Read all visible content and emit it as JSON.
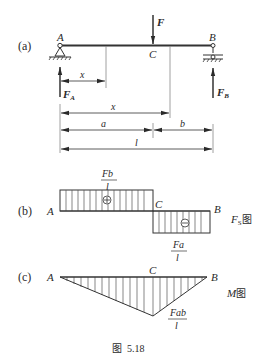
{
  "figure": {
    "caption": "图  5.18",
    "panel_a": {
      "label": "(a)",
      "point_A": "A",
      "point_B": "B",
      "point_C": "C",
      "load": "F",
      "reaction_A": "F",
      "reaction_A_sub": "A",
      "reaction_B": "F",
      "reaction_B_sub": "B",
      "dim_x_short": "x",
      "dim_x_long": "x",
      "dim_a": "a",
      "dim_b": "b",
      "dim_l": "l"
    },
    "panel_b": {
      "label": "(b)",
      "point_A": "A",
      "point_B": "B",
      "point_C": "C",
      "pos_num": "Fb",
      "pos_den": "l",
      "neg_num": "Fa",
      "neg_den": "l",
      "plus_sign": "+",
      "minus_sign": "−",
      "diagram_name": "F",
      "diagram_sub": "S",
      "diagram_suffix": "图"
    },
    "panel_c": {
      "label": "(c)",
      "point_A": "A",
      "point_B": "B",
      "point_C": "C",
      "max_num": "Fab",
      "max_den": "l",
      "diagram_name": "M",
      "diagram_suffix": "图"
    }
  },
  "colors": {
    "line": "#3a3a3a",
    "hatch": "#555555",
    "text": "#2a2a2a"
  }
}
